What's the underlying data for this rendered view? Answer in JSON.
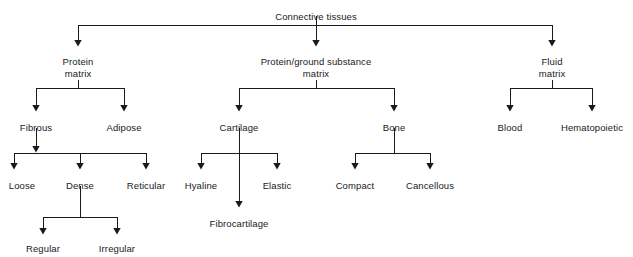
{
  "diagram": {
    "title": "Connective tissues",
    "type": "hierarchy-tree",
    "line_color": "#1a1a1a",
    "text_color": "#1a1a1a",
    "background_color": "#ffffff",
    "nodes": [
      {
        "id": "root",
        "label": "Connective tissues",
        "x": 316,
        "y": 11,
        "level": 0
      },
      {
        "id": "protein",
        "label": "Protein\nmatrix",
        "x": 78,
        "y": 56,
        "level": 1
      },
      {
        "id": "ground",
        "label": "Protein/ground substance\nmatrix",
        "x": 316,
        "y": 56,
        "level": 1
      },
      {
        "id": "fluid",
        "label": "Fluid\nmatrix",
        "x": 552,
        "y": 56,
        "level": 1
      },
      {
        "id": "fibrous",
        "label": "Fibrous",
        "x": 36,
        "y": 122,
        "level": 2
      },
      {
        "id": "adipose",
        "label": "Adipose",
        "x": 124,
        "y": 122,
        "level": 2
      },
      {
        "id": "cartilage",
        "label": "Cartilage",
        "x": 239,
        "y": 122,
        "level": 2
      },
      {
        "id": "bone",
        "label": "Bone",
        "x": 394,
        "y": 122,
        "level": 2
      },
      {
        "id": "blood",
        "label": "Blood",
        "x": 510,
        "y": 122,
        "level": 2
      },
      {
        "id": "hematopoietic",
        "label": "Hematopoietic",
        "x": 592,
        "y": 122,
        "level": 2
      },
      {
        "id": "loose",
        "label": "Loose",
        "x": 22,
        "y": 180,
        "level": 3
      },
      {
        "id": "dense",
        "label": "Dense",
        "x": 80,
        "y": 180,
        "level": 3
      },
      {
        "id": "reticular",
        "label": "Reticular",
        "x": 146,
        "y": 180,
        "level": 3
      },
      {
        "id": "hyaline",
        "label": "Hyaline",
        "x": 201,
        "y": 180,
        "level": 3
      },
      {
        "id": "elastic",
        "label": "Elastic",
        "x": 277,
        "y": 180,
        "level": 3
      },
      {
        "id": "compact",
        "label": "Compact",
        "x": 355,
        "y": 180,
        "level": 3
      },
      {
        "id": "cancellous",
        "label": "Cancellous",
        "x": 430,
        "y": 180,
        "level": 3
      },
      {
        "id": "fibrocartilage",
        "label": "Fibrocartilage",
        "x": 239,
        "y": 218,
        "level": 4
      },
      {
        "id": "regular",
        "label": "Regular",
        "x": 43,
        "y": 243,
        "level": 4
      },
      {
        "id": "irregular",
        "label": "Irregular",
        "x": 117,
        "y": 243,
        "level": 4
      }
    ],
    "edges": [
      {
        "from": "root",
        "to": "protein"
      },
      {
        "from": "root",
        "to": "ground"
      },
      {
        "from": "root",
        "to": "fluid"
      },
      {
        "from": "protein",
        "to": "fibrous"
      },
      {
        "from": "protein",
        "to": "adipose"
      },
      {
        "from": "ground",
        "to": "cartilage"
      },
      {
        "from": "ground",
        "to": "bone"
      },
      {
        "from": "fluid",
        "to": "blood"
      },
      {
        "from": "fluid",
        "to": "hematopoietic"
      },
      {
        "from": "fibrous",
        "to": "loose"
      },
      {
        "from": "fibrous",
        "to": "dense"
      },
      {
        "from": "fibrous",
        "to": "reticular"
      },
      {
        "from": "cartilage",
        "to": "hyaline"
      },
      {
        "from": "cartilage",
        "to": "elastic"
      },
      {
        "from": "cartilage",
        "to": "fibrocartilage"
      },
      {
        "from": "bone",
        "to": "compact"
      },
      {
        "from": "bone",
        "to": "cancellous"
      },
      {
        "from": "dense",
        "to": "regular"
      },
      {
        "from": "dense",
        "to": "irregular"
      }
    ]
  }
}
